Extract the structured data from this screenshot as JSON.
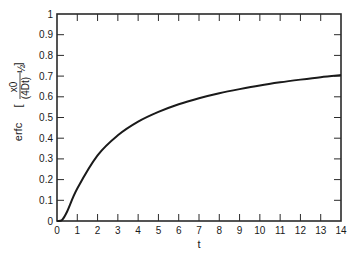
{
  "chart_data": {
    "type": "line",
    "title": "",
    "xlabel": "t",
    "ylabel": "erfc [x0 / (4Dt)^1/2]",
    "ylabel_parts": {
      "func": "erfc",
      "numerator": "x0",
      "denominator": "(4Dt)",
      "exponent": "½"
    },
    "xlim": [
      0,
      14
    ],
    "ylim": [
      0,
      1
    ],
    "x_ticks": [
      0,
      1,
      2,
      3,
      4,
      5,
      6,
      7,
      8,
      9,
      10,
      11,
      12,
      13,
      14
    ],
    "y_ticks": [
      0,
      0.1,
      0.2,
      0.3,
      0.4,
      0.5,
      0.6,
      0.7,
      0.8,
      0.9,
      1
    ],
    "y_tick_labels": [
      "0",
      "0.1",
      "0.2",
      "0.3",
      "0.4",
      "0.5",
      "0.6",
      "0.7",
      "0.8",
      "0.9",
      "1"
    ],
    "grid": false,
    "legend": null,
    "series": [
      {
        "name": "erfc",
        "x": [
          0,
          0.25,
          0.5,
          1,
          2,
          3,
          4,
          5,
          6,
          7,
          8,
          9,
          10,
          11,
          12,
          13,
          14
        ],
        "values": [
          0,
          0.005,
          0.046,
          0.157,
          0.317,
          0.414,
          0.48,
          0.527,
          0.564,
          0.593,
          0.617,
          0.637,
          0.655,
          0.67,
          0.683,
          0.695,
          0.705
        ]
      }
    ]
  }
}
